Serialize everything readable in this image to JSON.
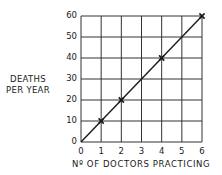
{
  "chart_data": {
    "type": "line",
    "title": "",
    "xlabel": "Nº OF DOCTORS PRACTICING",
    "ylabel_line1": "DEATHS",
    "ylabel_line2": "PER YEAR",
    "xlim": [
      0,
      6
    ],
    "ylim": [
      0,
      60
    ],
    "x_ticks": [
      "0",
      "1",
      "2",
      "3",
      "4",
      "5",
      "6"
    ],
    "y_ticks": [
      "0",
      "10",
      "20",
      "30",
      "40",
      "50",
      "60"
    ],
    "grid": true,
    "legend": null,
    "series": [
      {
        "name": "Deaths per year",
        "line_x": [
          0,
          6
        ],
        "line_y": [
          0,
          60
        ],
        "markers_x": [
          1,
          2,
          4,
          6
        ],
        "markers_y": [
          10,
          20,
          40,
          60
        ],
        "marker": "x"
      }
    ],
    "colors": {
      "line": "#1a1a1a",
      "grid": "#333333",
      "background": "#ffffff"
    }
  }
}
